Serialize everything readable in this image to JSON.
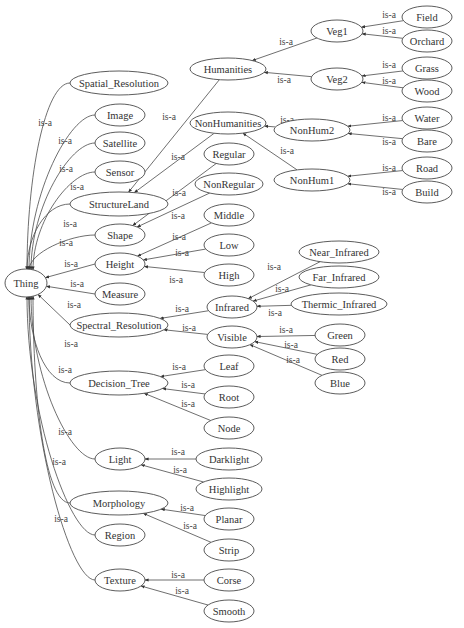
{
  "diagram": {
    "type": "ontology-graph",
    "edge_label": "is-a",
    "root": "Thing",
    "nodes": [
      {
        "id": "Thing",
        "label": "Thing",
        "x": 26,
        "y": 283,
        "rx": 21,
        "ry": 14
      },
      {
        "id": "Spatial_Resolution",
        "label": "Spatial_Resolution",
        "x": 119,
        "y": 83,
        "rx": 49,
        "ry": 12
      },
      {
        "id": "Image",
        "label": "Image",
        "x": 120,
        "y": 115,
        "rx": 25,
        "ry": 11
      },
      {
        "id": "Satellite",
        "label": "Satellite",
        "x": 120,
        "y": 143,
        "rx": 25,
        "ry": 11
      },
      {
        "id": "Sensor",
        "label": "Sensor",
        "x": 120,
        "y": 172,
        "rx": 25,
        "ry": 11
      },
      {
        "id": "StructureLand",
        "label": "StructureLand",
        "x": 119,
        "y": 204,
        "rx": 49,
        "ry": 12
      },
      {
        "id": "Shape",
        "label": "Shape",
        "x": 120,
        "y": 235,
        "rx": 25,
        "ry": 11
      },
      {
        "id": "Height",
        "label": "Height",
        "x": 120,
        "y": 264,
        "rx": 25,
        "ry": 11
      },
      {
        "id": "Measure",
        "label": "Measure",
        "x": 120,
        "y": 294,
        "rx": 25,
        "ry": 11
      },
      {
        "id": "Spectral_Resolution",
        "label": "Spectral_Resolution",
        "x": 119,
        "y": 325,
        "rx": 49,
        "ry": 12
      },
      {
        "id": "Decision_Tree",
        "label": "Decision_Tree",
        "x": 119,
        "y": 383,
        "rx": 49,
        "ry": 12
      },
      {
        "id": "Light",
        "label": "Light",
        "x": 120,
        "y": 459,
        "rx": 25,
        "ry": 11
      },
      {
        "id": "Morphology",
        "label": "Morphology",
        "x": 119,
        "y": 503,
        "rx": 49,
        "ry": 12
      },
      {
        "id": "Region",
        "label": "Region",
        "x": 120,
        "y": 535,
        "rx": 25,
        "ry": 11
      },
      {
        "id": "Texture",
        "label": "Texture",
        "x": 120,
        "y": 580,
        "rx": 25,
        "ry": 11
      },
      {
        "id": "Humanities",
        "label": "Humanities",
        "x": 228,
        "y": 69,
        "rx": 38,
        "ry": 11
      },
      {
        "id": "NonHumanities",
        "label": "NonHumanities",
        "x": 228,
        "y": 123,
        "rx": 38,
        "ry": 11
      },
      {
        "id": "Regular",
        "label": "Regular",
        "x": 229,
        "y": 154,
        "rx": 25,
        "ry": 11
      },
      {
        "id": "NonRegular",
        "label": "NonRegular",
        "x": 229,
        "y": 184,
        "rx": 34,
        "ry": 11
      },
      {
        "id": "Middle",
        "label": "Middle",
        "x": 229,
        "y": 215,
        "rx": 25,
        "ry": 11
      },
      {
        "id": "Low",
        "label": "Low",
        "x": 229,
        "y": 245,
        "rx": 25,
        "ry": 11
      },
      {
        "id": "High",
        "label": "High",
        "x": 229,
        "y": 275,
        "rx": 25,
        "ry": 11
      },
      {
        "id": "Infrared",
        "label": "Infrared",
        "x": 232,
        "y": 307,
        "rx": 25,
        "ry": 11
      },
      {
        "id": "Visible",
        "label": "Visible",
        "x": 232,
        "y": 337,
        "rx": 25,
        "ry": 11
      },
      {
        "id": "Leaf",
        "label": "Leaf",
        "x": 229,
        "y": 366,
        "rx": 25,
        "ry": 11
      },
      {
        "id": "Root",
        "label": "Root",
        "x": 229,
        "y": 397,
        "rx": 25,
        "ry": 11
      },
      {
        "id": "Node",
        "label": "Node",
        "x": 229,
        "y": 428,
        "rx": 25,
        "ry": 11
      },
      {
        "id": "Darklight",
        "label": "Darklight",
        "x": 229,
        "y": 459,
        "rx": 33,
        "ry": 11
      },
      {
        "id": "Highlight",
        "label": "Highlight",
        "x": 229,
        "y": 489,
        "rx": 33,
        "ry": 11
      },
      {
        "id": "Planar",
        "label": "Planar",
        "x": 229,
        "y": 519,
        "rx": 25,
        "ry": 11
      },
      {
        "id": "Strip",
        "label": "Strip",
        "x": 229,
        "y": 550,
        "rx": 25,
        "ry": 11
      },
      {
        "id": "Corse",
        "label": "Corse",
        "x": 229,
        "y": 580,
        "rx": 25,
        "ry": 11
      },
      {
        "id": "Smooth",
        "label": "Smooth",
        "x": 229,
        "y": 611,
        "rx": 25,
        "ry": 11
      },
      {
        "id": "Veg1",
        "label": "Veg1",
        "x": 337,
        "y": 31,
        "rx": 26,
        "ry": 11
      },
      {
        "id": "Veg2",
        "label": "Veg2",
        "x": 337,
        "y": 79,
        "rx": 26,
        "ry": 11
      },
      {
        "id": "NonHum2",
        "label": "NonHum2",
        "x": 312,
        "y": 130,
        "rx": 38,
        "ry": 11
      },
      {
        "id": "NonHum1",
        "label": "NonHum1",
        "x": 312,
        "y": 180,
        "rx": 38,
        "ry": 11
      },
      {
        "id": "Field",
        "label": "Field",
        "x": 427,
        "y": 17,
        "rx": 25,
        "ry": 11
      },
      {
        "id": "Orchard",
        "label": "Orchard",
        "x": 427,
        "y": 41,
        "rx": 25,
        "ry": 11
      },
      {
        "id": "Grass",
        "label": "Grass",
        "x": 427,
        "y": 68,
        "rx": 25,
        "ry": 11
      },
      {
        "id": "Wood",
        "label": "Wood",
        "x": 427,
        "y": 91,
        "rx": 25,
        "ry": 11
      },
      {
        "id": "Water",
        "label": "Water",
        "x": 427,
        "y": 118,
        "rx": 25,
        "ry": 11
      },
      {
        "id": "Bare",
        "label": "Bare",
        "x": 427,
        "y": 141,
        "rx": 25,
        "ry": 11
      },
      {
        "id": "Road",
        "label": "Road",
        "x": 427,
        "y": 168,
        "rx": 25,
        "ry": 11
      },
      {
        "id": "Build",
        "label": "Build",
        "x": 427,
        "y": 192,
        "rx": 25,
        "ry": 11
      },
      {
        "id": "Near_Infrared",
        "label": "Near_Infrared",
        "x": 339,
        "y": 252,
        "rx": 40,
        "ry": 11
      },
      {
        "id": "Far_Infrared",
        "label": "Far_Infrared",
        "x": 339,
        "y": 277,
        "rx": 40,
        "ry": 11
      },
      {
        "id": "Thermic_Infrared",
        "label": "Thermic_Infrared",
        "x": 339,
        "y": 304,
        "rx": 48,
        "ry": 11
      },
      {
        "id": "Green",
        "label": "Green",
        "x": 340,
        "y": 335,
        "rx": 25,
        "ry": 11
      },
      {
        "id": "Red",
        "label": "Red",
        "x": 340,
        "y": 359,
        "rx": 25,
        "ry": 11
      },
      {
        "id": "Blue",
        "label": "Blue",
        "x": 340,
        "y": 383,
        "rx": 25,
        "ry": 11
      }
    ],
    "edges": [
      {
        "from": "Spatial_Resolution",
        "to": "Thing",
        "lx": 45,
        "ly": 123
      },
      {
        "from": "Image",
        "to": "Thing",
        "lx": 65,
        "ly": 141
      },
      {
        "from": "Satellite",
        "to": "Thing",
        "lx": 66,
        "ly": 169
      },
      {
        "from": "Sensor",
        "to": "Thing",
        "lx": 77,
        "ly": 187
      },
      {
        "from": "StructureLand",
        "to": "Thing",
        "lx": 70,
        "ly": 224
      },
      {
        "from": "Shape",
        "to": "Thing",
        "lx": 66,
        "ly": 243
      },
      {
        "from": "Height",
        "to": "Thing",
        "lx": 71,
        "ly": 264
      },
      {
        "from": "Measure",
        "to": "Thing",
        "lx": 77,
        "ly": 284
      },
      {
        "from": "Spectral_Resolution",
        "to": "Thing",
        "lx": 74,
        "ly": 305
      },
      {
        "from": "Decision_Tree",
        "to": "Thing",
        "lx": 71,
        "ly": 344
      },
      {
        "from": "Light",
        "to": "Thing",
        "lx": 65,
        "ly": 370
      },
      {
        "from": "Morphology",
        "to": "Thing",
        "lx": 65,
        "ly": 432
      },
      {
        "from": "Region",
        "to": "Thing",
        "lx": 59,
        "ly": 462
      },
      {
        "from": "Texture",
        "to": "Thing",
        "lx": 61,
        "ly": 519
      },
      {
        "from": "Humanities",
        "to": "StructureLand",
        "lx": 169,
        "ly": 117
      },
      {
        "from": "NonHumanities",
        "to": "StructureLand",
        "lx": 178,
        "ly": 157
      },
      {
        "from": "Regular",
        "to": "Shape",
        "lx": 179,
        "ly": 193
      },
      {
        "from": "NonRegular",
        "to": "Shape",
        "lx": 178,
        "ly": 216
      },
      {
        "from": "Middle",
        "to": "Height",
        "lx": 179,
        "ly": 237
      },
      {
        "from": "Low",
        "to": "Height",
        "lx": 182,
        "ly": 253
      },
      {
        "from": "High",
        "to": "Height",
        "lx": 176,
        "ly": 280
      },
      {
        "from": "Infrared",
        "to": "Spectral_Resolution",
        "lx": 182,
        "ly": 309
      },
      {
        "from": "Visible",
        "to": "Spectral_Resolution",
        "lx": 189,
        "ly": 328
      },
      {
        "from": "Leaf",
        "to": "Decision_Tree",
        "lx": 179,
        "ly": 367
      },
      {
        "from": "Root",
        "to": "Decision_Tree",
        "lx": 188,
        "ly": 385
      },
      {
        "from": "Node",
        "to": "Decision_Tree",
        "lx": 188,
        "ly": 404
      },
      {
        "from": "Darklight",
        "to": "Light",
        "lx": 178,
        "ly": 452
      },
      {
        "from": "Highlight",
        "to": "Light",
        "lx": 180,
        "ly": 470
      },
      {
        "from": "Planar",
        "to": "Morphology",
        "lx": 187,
        "ly": 508
      },
      {
        "from": "Strip",
        "to": "Morphology",
        "lx": 190,
        "ly": 526
      },
      {
        "from": "Corse",
        "to": "Texture",
        "lx": 178,
        "ly": 575
      },
      {
        "from": "Smooth",
        "to": "Texture",
        "lx": 182,
        "ly": 591
      },
      {
        "from": "Veg1",
        "to": "Humanities",
        "lx": 286,
        "ly": 42
      },
      {
        "from": "Veg2",
        "to": "Humanities",
        "lx": 284,
        "ly": 80
      },
      {
        "from": "NonHum2",
        "to": "NonHumanities",
        "lx": 287,
        "ly": 120
      },
      {
        "from": "NonHum1",
        "to": "NonHumanities",
        "lx": 287,
        "ly": 151
      },
      {
        "from": "Field",
        "to": "Veg1",
        "lx": 389,
        "ly": 15
      },
      {
        "from": "Orchard",
        "to": "Veg1",
        "lx": 389,
        "ly": 31
      },
      {
        "from": "Grass",
        "to": "Veg2",
        "lx": 389,
        "ly": 65
      },
      {
        "from": "Wood",
        "to": "Veg2",
        "lx": 389,
        "ly": 81
      },
      {
        "from": "Water",
        "to": "NonHum2",
        "lx": 389,
        "ly": 118
      },
      {
        "from": "Bare",
        "to": "NonHum2",
        "lx": 389,
        "ly": 142
      },
      {
        "from": "Road",
        "to": "NonHum1",
        "lx": 389,
        "ly": 168
      },
      {
        "from": "Build",
        "to": "NonHum1",
        "lx": 389,
        "ly": 192
      },
      {
        "from": "Near_Infrared",
        "to": "Infrared",
        "lx": 274,
        "ly": 267
      },
      {
        "from": "Far_Infrared",
        "to": "Infrared",
        "lx": 282,
        "ly": 289
      },
      {
        "from": "Thermic_Infrared",
        "to": "Infrared",
        "lx": 275,
        "ly": 313
      },
      {
        "from": "Green",
        "to": "Visible",
        "lx": 286,
        "ly": 330
      },
      {
        "from": "Red",
        "to": "Visible",
        "lx": 291,
        "ly": 345
      },
      {
        "from": "Blue",
        "to": "Visible",
        "lx": 293,
        "ly": 360
      }
    ]
  },
  "colors": {
    "background": "#ffffff",
    "stroke": "#4a4a4a",
    "text": "#333333"
  }
}
